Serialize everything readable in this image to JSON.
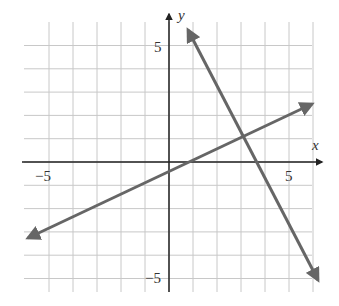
{
  "chart_data": {
    "type": "line",
    "title": "",
    "xlabel": "x",
    "ylabel": "y",
    "xlim": [
      -6,
      6
    ],
    "ylim": [
      -6,
      6
    ],
    "grid": true,
    "tick_labels": {
      "x": [
        "-5",
        "5"
      ],
      "y": [
        "5",
        "-5"
      ]
    },
    "series": [
      {
        "name": "line 1",
        "equation": "y = 0.5x - 0.5",
        "x": [
          -6,
          6
        ],
        "y": [
          -3.5,
          2.5
        ]
      },
      {
        "name": "line 2",
        "equation": "y = -2x + 7",
        "x": [
          0.5,
          6.5
        ],
        "y": [
          6,
          -6
        ]
      }
    ],
    "intersection": {
      "x": 3,
      "y": 1
    }
  },
  "labels": {
    "x_axis": "x",
    "y_axis": "y",
    "x_neg5": "−5",
    "x_pos5": "5",
    "y_pos5": "5",
    "y_neg5": "−5"
  },
  "colors": {
    "grid": "#c8c8c8",
    "axis": "#222222",
    "line": "#666666"
  }
}
